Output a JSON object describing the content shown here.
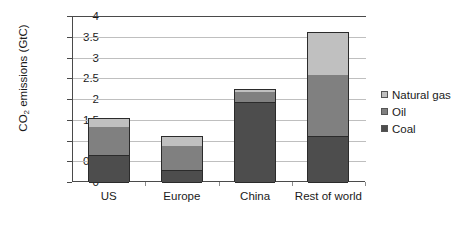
{
  "chart_data": {
    "type": "bar",
    "subtype": "stacked-bar",
    "title": "",
    "xlabel": "",
    "ylabel": "CO2 emissions (GtC)",
    "ylabel_parts": {
      "pre": "CO",
      "sub": "2",
      "post": " emissions  (GtC)"
    },
    "categories": [
      "US",
      "Europe",
      "China",
      "Rest of world"
    ],
    "series": [
      {
        "name": "Coal",
        "color": "#4d4d4d",
        "values": [
          0.65,
          0.3,
          1.92,
          1.12
        ]
      },
      {
        "name": "Oil",
        "color": "#808080",
        "values": [
          0.7,
          0.58,
          0.28,
          1.48
        ]
      },
      {
        "name": "Natural gas",
        "color": "#c0c0c0",
        "values": [
          0.2,
          0.24,
          0.05,
          1.02
        ]
      }
    ],
    "totals": [
      1.55,
      1.12,
      2.25,
      3.62
    ],
    "ylim": [
      0,
      4
    ],
    "yticks": [
      "0",
      "0.5",
      "1",
      "1.5",
      "2",
      "2.5",
      "3",
      "3.5",
      "4"
    ],
    "ytick_values": [
      0,
      0.5,
      1,
      1.5,
      2,
      2.5,
      3,
      3.5,
      4
    ],
    "grid": "horizontal",
    "legend_position": "right",
    "legend_order": [
      "Natural gas",
      "Oil",
      "Coal"
    ]
  }
}
